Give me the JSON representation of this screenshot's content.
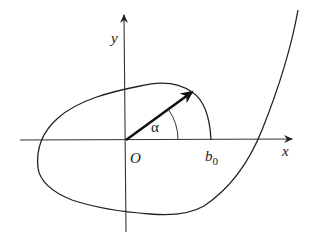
{
  "diagram": {
    "type": "polar-curve",
    "axes": {
      "x_label": "x",
      "y_label": "y",
      "origin_label": "O"
    },
    "angle_label": "α",
    "point_label": {
      "base": "b",
      "subscript": "0"
    },
    "colors": {
      "ink": "#1a1a1a",
      "axis": "#333333",
      "background": "#ffffff"
    }
  }
}
